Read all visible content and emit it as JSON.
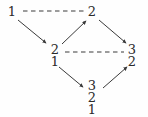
{
  "diagram": {
    "type": "hasse-diagram",
    "width": 148,
    "height": 117,
    "background_color": "#fefefe",
    "stroke_color": "#3a3a3a",
    "text_color": "#2b2b2b",
    "nodes": [
      {
        "id": "n1",
        "name": "node-1",
        "entries": [
          "1"
        ],
        "x": 12,
        "y": 11
      },
      {
        "id": "n2",
        "name": "node-2",
        "entries": [
          "2"
        ],
        "x": 92,
        "y": 11
      },
      {
        "id": "n21",
        "name": "node-2-1",
        "entries": [
          "2",
          "1"
        ],
        "x": 55,
        "y": 55
      },
      {
        "id": "n32",
        "name": "node-3-2",
        "entries": [
          "3",
          "2"
        ],
        "x": 132,
        "y": 55
      },
      {
        "id": "n321",
        "name": "node-3-2-1",
        "entries": [
          "3",
          "2",
          "1"
        ],
        "x": 92,
        "y": 97
      }
    ],
    "dashed_edges": [
      {
        "name": "dashed-edge-1-to-2",
        "from": "n1",
        "to": "n2",
        "x1": 23,
        "y1": 11,
        "x2": 84,
        "y2": 11
      },
      {
        "name": "dashed-edge-21-to-32",
        "from": "n21",
        "to": "n32",
        "x1": 65,
        "y1": 52,
        "x2": 124,
        "y2": 52
      }
    ],
    "arrow_edges": [
      {
        "name": "arrow-edge-1-to-21",
        "from": "n1",
        "to": "n21",
        "x1": 18,
        "y1": 20,
        "x2": 46,
        "y2": 43
      },
      {
        "name": "arrow-edge-21-to-2",
        "from": "n21",
        "to": "n2",
        "x1": 62,
        "y1": 44,
        "x2": 86,
        "y2": 21
      },
      {
        "name": "arrow-edge-2-to-32",
        "from": "n2",
        "to": "n32",
        "x1": 99,
        "y1": 20,
        "x2": 126,
        "y2": 43
      },
      {
        "name": "arrow-edge-21-to-321",
        "from": "n21",
        "to": "n321",
        "x1": 59,
        "y1": 67,
        "x2": 83,
        "y2": 87
      },
      {
        "name": "arrow-edge-321-to-32",
        "from": "n321",
        "to": "n32",
        "x1": 103,
        "y1": 88,
        "x2": 127,
        "y2": 67
      }
    ]
  }
}
